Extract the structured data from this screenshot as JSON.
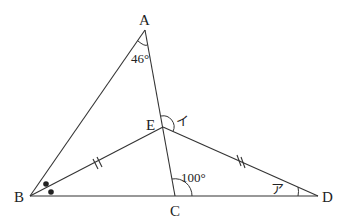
{
  "diagram": {
    "type": "geometry-figure",
    "vertices": {
      "A": {
        "label": "A",
        "x": 145,
        "y": 30
      },
      "B": {
        "label": "B",
        "x": 30,
        "y": 196
      },
      "C": {
        "label": "C",
        "x": 175,
        "y": 196
      },
      "D": {
        "label": "D",
        "x": 318,
        "y": 196
      },
      "E": {
        "label": "E",
        "x": 163,
        "y": 127
      }
    },
    "segments": [
      "AB",
      "AC",
      "BE",
      "ED",
      "BD"
    ],
    "angles": {
      "A": {
        "label": "46°"
      },
      "C": {
        "label": "100°"
      },
      "E": {
        "label": "イ"
      },
      "D": {
        "label": "ア"
      }
    },
    "markings": {
      "equal_segments": [
        "BE",
        "ED"
      ],
      "equal_angle_dots_at": "B"
    }
  }
}
